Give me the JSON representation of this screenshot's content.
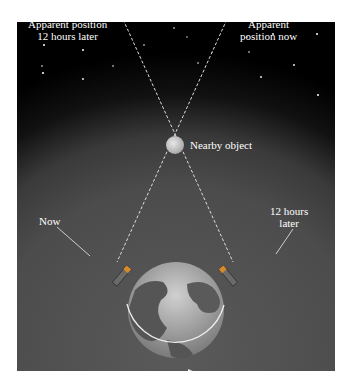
{
  "figure": {
    "labels": {
      "apparent_later_line1": "Apparent position",
      "apparent_later_line2": "12 hours later",
      "apparent_now_line1": "Apparent",
      "apparent_now_line2": "position now",
      "nearby_object": "Nearby object",
      "now": "Now",
      "later_line1": "12 hours",
      "later_line2": "later"
    },
    "colors": {
      "space": "#000000",
      "sky_glow": "#4c4c4c",
      "lines": "#dddddd",
      "text": "#ffffff"
    }
  }
}
